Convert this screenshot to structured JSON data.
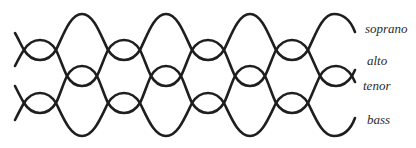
{
  "diagram": {
    "line_color": "#1e1e1e",
    "labels": [
      {
        "text": "soprano",
        "x": 365,
        "y": 22
      },
      {
        "text": "alto",
        "x": 367,
        "y": 54
      },
      {
        "text": "tenor",
        "x": 363,
        "y": 79
      },
      {
        "text": "bass",
        "x": 367,
        "y": 113
      }
    ],
    "voices": [
      {
        "name": "soprano",
        "path": "M15,33 C18,38 21,45 24,50 C29,58 35,60 40,60 C45,60 51,58 56,50 C63,36 70,14 82,14 C94,14 101,36 108,50 C113,58 119,60 124,60 C129,60 135,58 140,50 C147,36 154,14 166,14 C178,14 185,36 192,50 C197,58 203,60 208,60 C213,60 219,58 224,50 C231,36 238,14 250,14 C262,14 269,36 276,50 C281,58 287,60 292,60 C297,60 303,58 308,50 C315,36 322,14 334,14 C346,14 352,24 355,32"
      },
      {
        "name": "alto",
        "path": "M15,66 C18,60 21,54 24,50 C29,42 35,40 40,40 C45,40 51,42 56,50 C60,58 63,68 67,76 C71,83 76,86 82,86 C88,86 93,83 97,76 C101,68 104,58 108,50 C113,42 119,40 124,40 C129,40 135,42 140,50 C144,58 147,68 151,76 C155,83 160,86 166,86 C172,86 177,83 181,76 C185,68 188,58 192,50 C197,42 203,40 208,40 C213,40 219,42 224,50 C228,58 231,68 235,76 C239,83 244,86 250,86 C256,86 261,83 265,76 C269,68 272,58 276,50 C281,42 287,40 292,40 C297,40 303,42 308,50 C312,58 316,68 320,76 C324,83 330,86 336,86 C342,86 348,82 352,76 C353,74 354,72 355,70"
      },
      {
        "name": "tenor",
        "path": "M15,86 C18,92 21,98 24,103 C29,111 35,113 40,113 C45,113 51,111 56,103 C60,95 63,84 67,76 C71,69 76,66 82,66 C88,66 93,69 97,76 C101,84 104,95 108,103 C113,111 119,113 124,113 C129,113 135,111 140,103 C144,95 147,84 151,76 C155,69 160,66 166,66 C172,66 177,69 181,76 C185,84 188,95 192,103 C197,111 203,113 208,113 C213,113 219,111 224,103 C228,95 231,84 235,76 C239,69 244,66 250,66 C256,66 261,69 265,76 C269,84 272,95 276,103 C281,111 287,113 292,113 C297,113 303,111 308,103 C312,95 316,84 320,76 C324,69 330,66 336,66 C342,66 348,70 352,76 C353,78 354,80 355,82"
      },
      {
        "name": "bass",
        "path": "M15,120 C18,114 21,108 24,103 C29,95 35,93 40,93 C45,93 51,95 56,103 C63,117 70,136 82,136 C94,136 101,117 108,103 C113,95 119,93 124,93 C129,93 135,95 140,103 C147,117 154,136 166,136 C178,136 185,117 192,103 C197,95 203,93 208,93 C213,93 219,95 224,103 C231,117 238,136 250,136 C262,136 269,117 276,103 C281,95 287,93 292,93 C297,93 303,95 308,103 C315,117 322,136 334,136 C346,136 352,126 355,118"
      }
    ]
  }
}
